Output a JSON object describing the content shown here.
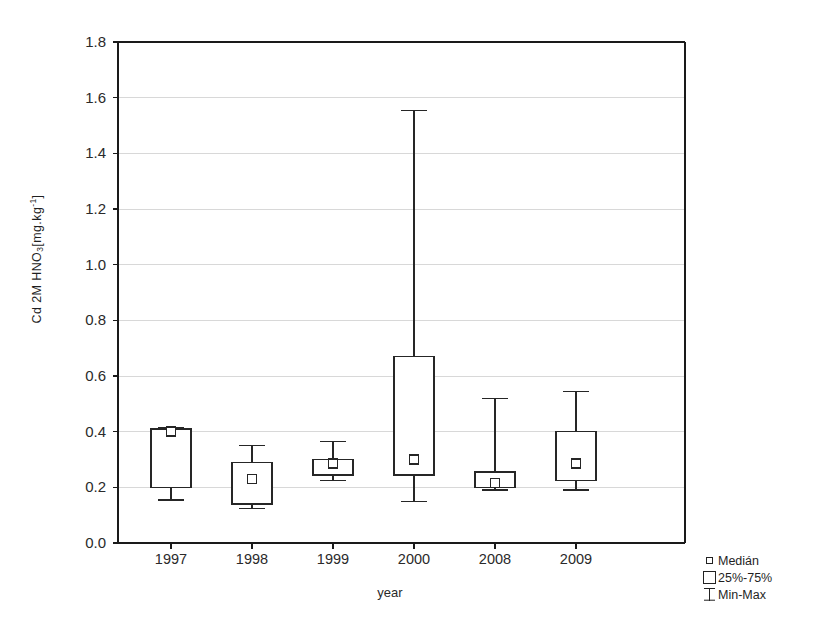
{
  "chart_data": {
    "type": "box",
    "title": "",
    "xlabel": "year",
    "ylabel_text": "Cd 2M HNO3 [mg.kg-1]",
    "ylabel_parts": {
      "prefix": "Cd 2M HNO",
      "sub": "3",
      "mid": "[mg.kg",
      "sup": "-1",
      "suffix": "]"
    },
    "categories": [
      "1997",
      "1998",
      "1999",
      "2000",
      "2008",
      "2009"
    ],
    "ylim": [
      0.0,
      1.8
    ],
    "ytick_labels": [
      "0.0",
      "0.2",
      "0.4",
      "0.6",
      "0.8",
      "1.0",
      "1.2",
      "1.4",
      "1.6",
      "1.8"
    ],
    "ytick_values": [
      0.0,
      0.2,
      0.4,
      0.6,
      0.8,
      1.0,
      1.2,
      1.4,
      1.6,
      1.8
    ],
    "grid": true,
    "legend_position": "outside-bottom-right",
    "boxes": [
      {
        "category": "1997",
        "min": 0.155,
        "q1": 0.2,
        "median": 0.4,
        "q3": 0.41,
        "max": 0.415
      },
      {
        "category": "1998",
        "min": 0.125,
        "q1": 0.14,
        "median": 0.23,
        "q3": 0.29,
        "max": 0.35
      },
      {
        "category": "1999",
        "min": 0.225,
        "q1": 0.245,
        "median": 0.285,
        "q3": 0.3,
        "max": 0.365
      },
      {
        "category": "2000",
        "min": 0.15,
        "q1": 0.245,
        "median": 0.3,
        "q3": 0.67,
        "max": 1.555
      },
      {
        "category": "2008",
        "min": 0.19,
        "q1": 0.2,
        "median": 0.215,
        "q3": 0.255,
        "max": 0.52
      },
      {
        "category": "2009",
        "min": 0.19,
        "q1": 0.225,
        "median": 0.285,
        "q3": 0.4,
        "max": 0.545
      }
    ]
  },
  "legend": {
    "items": [
      {
        "key": "median-marker",
        "label": "Medián"
      },
      {
        "key": "box-range",
        "label": "25%-75%"
      },
      {
        "key": "whisker-range",
        "label": "Min-Max"
      }
    ]
  },
  "colors": {
    "line": "#262626",
    "grid": "#d8d8d8",
    "axis": "#1a1a1a",
    "background": "#ffffff"
  }
}
